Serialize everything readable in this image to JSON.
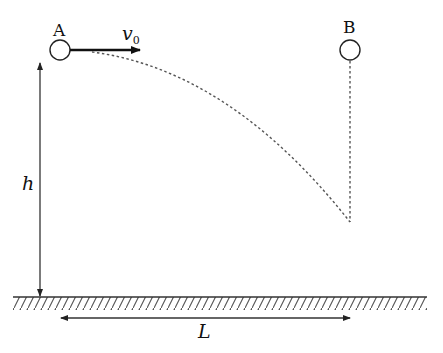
{
  "diagram": {
    "type": "projectile-motion",
    "ball_a": {
      "label": "A",
      "cx": 60,
      "cy": 50,
      "r": 10
    },
    "ball_b": {
      "label": "B",
      "cx": 350,
      "cy": 50,
      "r": 10
    },
    "velocity": {
      "symbol": "v",
      "subscript": "0",
      "direction": "right"
    },
    "height": {
      "label": "h"
    },
    "distance": {
      "label": "L"
    },
    "trajectory": {
      "style": "dashed",
      "start": [
        95,
        52
      ],
      "end": [
        350,
        222
      ]
    },
    "b_drop_line": {
      "style": "dashed",
      "from_y": 62,
      "to_y": 222
    },
    "ground": {
      "y": 297,
      "x_start": 13,
      "x_end": 427,
      "hatched": true
    },
    "colors": {
      "stroke": "#222222",
      "dashed": "#555555",
      "background": "#ffffff"
    }
  }
}
